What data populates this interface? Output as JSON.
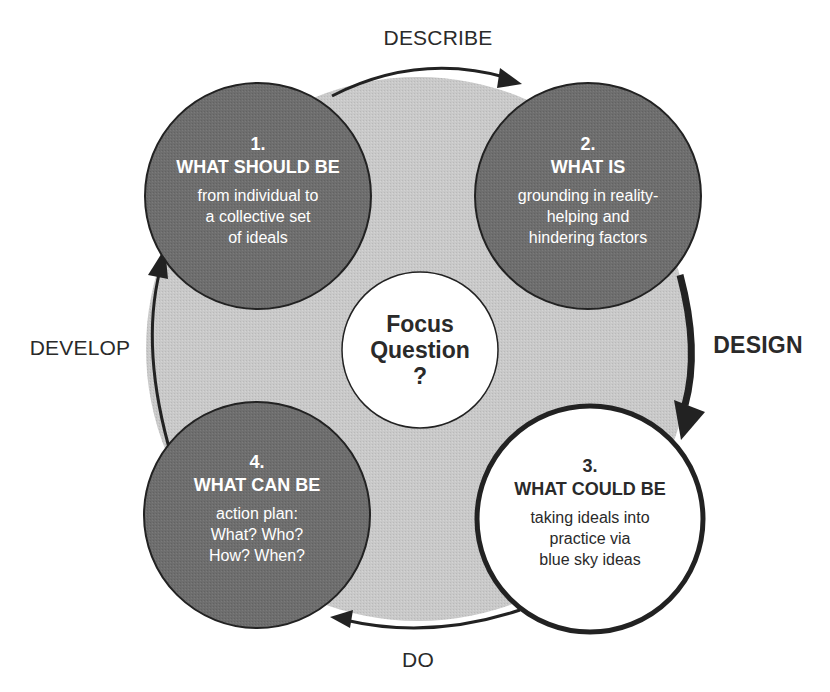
{
  "colors": {
    "background": "#ffffff",
    "ring_fill": "#c9c9c9",
    "dark_node_fill": "#6e6e6e",
    "light_node_fill": "#ffffff",
    "stroke": "#222222",
    "dark_text": "#2a2a2a",
    "light_text": "#ffffff"
  },
  "phases": {
    "top": "DESCRIBE",
    "right": "DESIGN",
    "bottom": "DO",
    "left": "DEVELOP"
  },
  "center": {
    "line1": "Focus",
    "line2": "Question",
    "line3": "?"
  },
  "nodes": [
    {
      "number": "1.",
      "title": "WHAT SHOULD BE",
      "desc": [
        "from individual to",
        "a collective set",
        "of ideals"
      ],
      "style": "dark"
    },
    {
      "number": "2.",
      "title": "WHAT IS",
      "desc": [
        "grounding in reality-",
        "helping and",
        "hindering factors"
      ],
      "style": "dark"
    },
    {
      "number": "3.",
      "title": "WHAT COULD BE",
      "desc": [
        "taking ideals into",
        "practice via",
        "blue sky ideas"
      ],
      "style": "light"
    },
    {
      "number": "4.",
      "title": "WHAT CAN BE",
      "desc": [
        "action plan:",
        "What? Who?",
        "How? When?"
      ],
      "style": "dark"
    }
  ],
  "arrows": [
    {
      "from": "1",
      "to": "2",
      "label": "DESCRIBE",
      "icon": "arrow-clockwise-top"
    },
    {
      "from": "2",
      "to": "3",
      "label": "DESIGN",
      "icon": "arrow-clockwise-right"
    },
    {
      "from": "3",
      "to": "4",
      "label": "DO",
      "icon": "arrow-clockwise-bottom"
    },
    {
      "from": "4",
      "to": "1",
      "label": "DEVELOP",
      "icon": "arrow-clockwise-left"
    }
  ]
}
